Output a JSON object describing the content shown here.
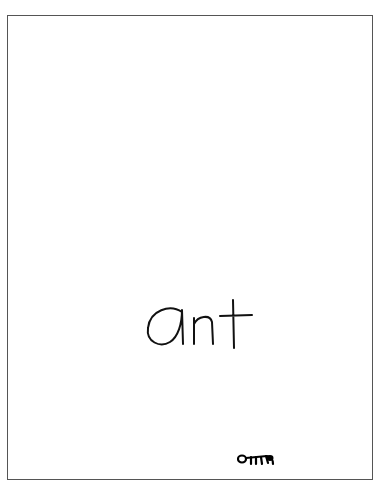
{
  "page": {
    "word": "ant",
    "drawing_label": "ant-drawing",
    "colors": {
      "ink": "#111111",
      "border": "#555555",
      "background": "#ffffff"
    }
  }
}
